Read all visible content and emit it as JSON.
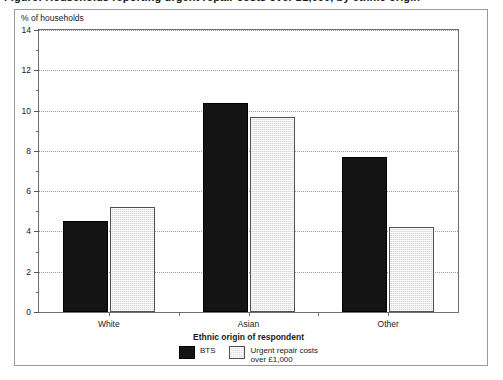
{
  "caption": {
    "text": "Figure: Households reporting urgent repair costs over £1,000, by ethnic origin"
  },
  "chart_data": {
    "type": "bar",
    "title": "",
    "subtitle": "",
    "xlabel": "Ethnic origin of respondent",
    "ylabel": "% of households",
    "categories": [
      "White",
      "Asian",
      "Other"
    ],
    "series": [
      {
        "name": "BTS",
        "color": "#141414",
        "values": [
          4.5,
          10.4,
          7.7
        ]
      },
      {
        "name": "Urgent repair costs\nover £1,000",
        "color": "#d8d8d8",
        "values": [
          5.2,
          9.7,
          4.2
        ]
      }
    ],
    "ylim": [
      0,
      14
    ],
    "yticks": [
      0,
      2,
      4,
      6,
      8,
      10,
      12,
      14
    ],
    "ytick_labels": [
      "0",
      "2",
      "4",
      "6",
      "8",
      "10",
      "12",
      "14"
    ],
    "yminor_ticks": [
      1,
      3,
      5,
      7,
      9,
      11,
      13
    ],
    "grid": true,
    "grid_axis": "y",
    "grid_style": "dotted",
    "legend_position": "bottom-center"
  }
}
